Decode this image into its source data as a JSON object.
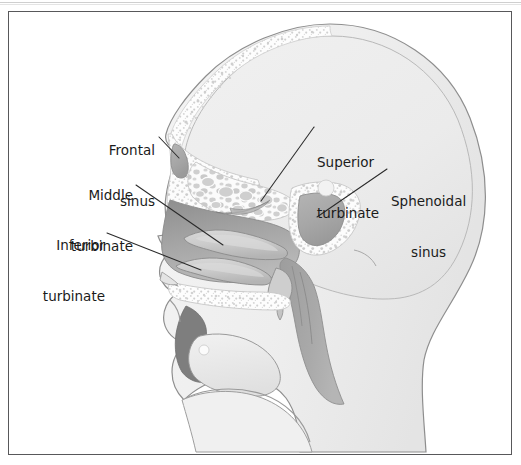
{
  "figure": {
    "type": "anatomical-illustration",
    "view": "lateral / mid-sagittal",
    "frame": {
      "border_color": "#58585a",
      "background": "#ffffff"
    },
    "palette": {
      "skin_outline": "#8a8a8a",
      "soft_tissue_light": "#efefef",
      "cranium_fill": "#ededed",
      "bone_white": "#fbfbfb",
      "spongy_bone_speck": "#d6d6d6",
      "nasal_mucosa_dark": "#9a9a9a",
      "turbinate_light": "#c9c9c9",
      "sinus_cavity_gray": "#a9a9a9",
      "pharynx_gray": "#a4a4a4",
      "leader_line": "#2a2a2a",
      "label_text": "#1b1b1b"
    },
    "labels": [
      {
        "id": "frontal-sinus",
        "lines": [
          "Frontal",
          "sinus"
        ],
        "text": "Frontal sinus",
        "align": "right",
        "side": "left"
      },
      {
        "id": "middle-turbinate",
        "lines": [
          "Middle",
          "turbinate"
        ],
        "text": "Middle turbinate",
        "align": "right",
        "side": "left"
      },
      {
        "id": "inferior-turbinate",
        "lines": [
          "Inferior",
          "turbinate"
        ],
        "text": "Inferior turbinate",
        "align": "right",
        "side": "left"
      },
      {
        "id": "superior-turbinate",
        "lines": [
          "Superior",
          "turbinate"
        ],
        "text": "Superior turbinate",
        "align": "left",
        "side": "right"
      },
      {
        "id": "sphenoidal-sinus",
        "lines": [
          "Sphenoidal",
          "sinus"
        ],
        "text": "Sphenoidal sinus",
        "align": "left",
        "side": "right"
      }
    ],
    "label_text": {
      "frontal_l1": "Frontal",
      "frontal_l2": "sinus",
      "middle_l1": "Middle",
      "middle_l2": "turbinate",
      "inferior_l1": "Inferior",
      "inferior_l2": "turbinate",
      "superior_l1": "Superior",
      "superior_l2": "turbinate",
      "sphenoid_l1": "Sphenoidal",
      "sphenoid_l2": "sinus"
    },
    "leader_lines": [
      {
        "id": "frontal-sinus-leader",
        "from": [
          160,
          140
        ],
        "to": [
          178,
          157
        ]
      },
      {
        "id": "middle-turbinate-leader",
        "from": [
          136,
          186
        ],
        "to": [
          222,
          244
        ]
      },
      {
        "id": "inferior-turbinate-leader",
        "from": [
          108,
          234
        ],
        "to": [
          200,
          270
        ]
      },
      {
        "id": "superior-turbinate-leader",
        "from": [
          314,
          126
        ],
        "to": [
          262,
          200
        ]
      },
      {
        "id": "sphenoidal-sinus-leader",
        "from": [
          388,
          168
        ],
        "to": [
          318,
          216
        ]
      }
    ],
    "structures": [
      "cranial vault",
      "frontal sinus",
      "ethmoid air cells",
      "superior turbinate",
      "middle turbinate",
      "inferior turbinate",
      "sphenoidal sinus",
      "nasal cavity",
      "hard palate",
      "tongue",
      "oral cavity",
      "nasopharynx",
      "oropharynx",
      "mandible"
    ]
  }
}
